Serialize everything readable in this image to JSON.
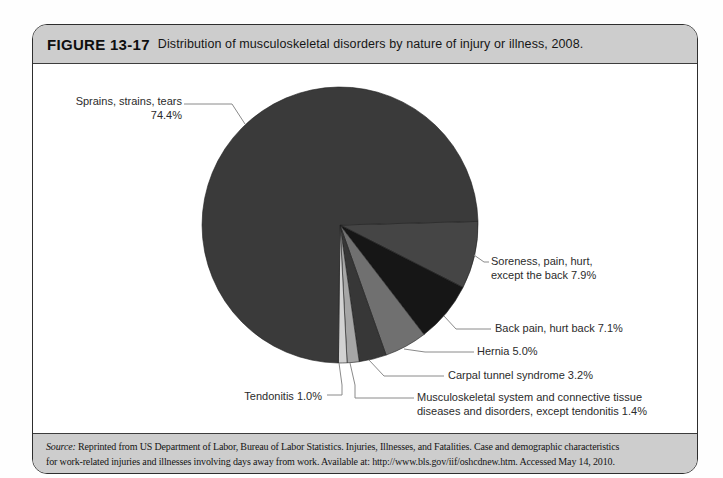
{
  "header": {
    "figure_label": "FIGURE 13-17",
    "title": "Distribution of musculoskeletal disorders by nature of injury or illness, 2008."
  },
  "footer": {
    "source_label": "Source:",
    "source_line1": "Reprinted from US Department of Labor, Bureau of Labor Statistics. Injuries, Illnesses, and Fatalities. Case and demographic characteristics",
    "source_line2": "for work-related injuries and illnesses involving days away from work. Available at: http://www.bls.gov/iif/oshcdnew.htm. Accessed May 14, 2010."
  },
  "chart_data": {
    "type": "pie",
    "title": "Distribution of musculoskeletal disorders by nature of injury or illness, 2008",
    "unit": "percent",
    "slices": [
      {
        "label": "Sprains, strains, tears",
        "value": 74.4,
        "color": "#3a3a3a"
      },
      {
        "label": "Soreness, pain, hurt, except the back",
        "value": 7.9,
        "color": "#454545"
      },
      {
        "label": "Back pain, hurt back",
        "value": 7.1,
        "color": "#161616"
      },
      {
        "label": "Hernia",
        "value": 5.0,
        "color": "#707070"
      },
      {
        "label": "Carpal tunnel syndrome",
        "value": 3.2,
        "color": "#373737"
      },
      {
        "label": "Musculoskeletal system and connective tissue diseases and disorders, except tendonitis",
        "value": 1.4,
        "color": "#a6a6a6"
      },
      {
        "label": "Tendonitis",
        "value": 1.0,
        "color": "#d2d2d2"
      }
    ],
    "layout": {
      "start_angle_deg": 1.5,
      "direction": "clockwise",
      "draw_order": [
        1,
        2,
        3,
        4,
        5,
        6,
        0
      ],
      "center": [
        340,
        225
      ],
      "radius": 138,
      "legend": "callout-labels-with-leader-lines"
    },
    "callouts": {
      "sprains": "Sprains, strains, tears\n74.4%",
      "soreness": "Soreness, pain, hurt,\nexcept the back 7.9%",
      "back_pain": "Back pain, hurt back 7.1%",
      "hernia": "Hernia 5.0%",
      "carpal": "Carpal tunnel syndrome 3.2%",
      "msk": "Musculoskeletal system and connective tissue\ndiseases and disorders, except tendonitis 1.4%",
      "tendonitis": "Tendonitis 1.0%"
    }
  }
}
